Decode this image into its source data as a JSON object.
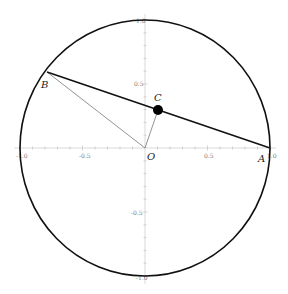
{
  "diagram": {
    "type": "unit-circle-chord",
    "axes": {
      "x_range": [
        -1.0,
        1.0
      ],
      "y_range": [
        -1.0,
        1.0
      ],
      "x_tick_labels": [
        "-1.0",
        "-0.5",
        "0.5",
        "1.0"
      ],
      "y_tick_labels": [
        "1.0",
        "0.5",
        "-0.5",
        "-1.0"
      ],
      "minor_tick_step": 0.1,
      "axis_color": "#c8c8c8"
    },
    "circle": {
      "center": [
        0,
        0
      ],
      "radius": 1,
      "stroke": "#111111"
    },
    "points": [
      {
        "id": "A",
        "label": "A",
        "coords": [
          1.0,
          0.0
        ]
      },
      {
        "id": "B",
        "label": "B",
        "coords": [
          -0.784,
          0.594
        ]
      },
      {
        "id": "C",
        "label": "C",
        "coords": [
          0.1,
          0.3
        ],
        "marker": "filled-dot"
      },
      {
        "id": "O",
        "label": "O",
        "coords": [
          0.0,
          0.0
        ]
      }
    ],
    "segments": [
      {
        "from": "A",
        "to": "B",
        "style": "thick",
        "color": "#111111"
      },
      {
        "from": "O",
        "to": "B",
        "style": "thin",
        "color": "#777777"
      },
      {
        "from": "O",
        "to": "C",
        "style": "thin",
        "color": "#777777"
      }
    ]
  }
}
